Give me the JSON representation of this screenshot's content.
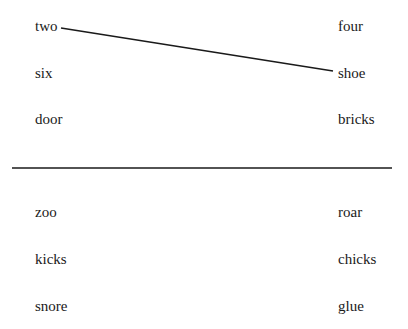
{
  "top_section": {
    "left_words": [
      "two",
      "six",
      "door"
    ],
    "right_words": [
      "four",
      "shoe",
      "bricks"
    ],
    "connections": [
      {
        "from": "two",
        "to": "shoe"
      }
    ]
  },
  "bottom_section": {
    "left_words": [
      "zoo",
      "kicks",
      "snore"
    ],
    "right_words": [
      "roar",
      "chicks",
      "glue"
    ],
    "connections": []
  },
  "colors": {
    "line": "#1a1a1a",
    "text": "#1a1a1a",
    "background": "#ffffff"
  }
}
